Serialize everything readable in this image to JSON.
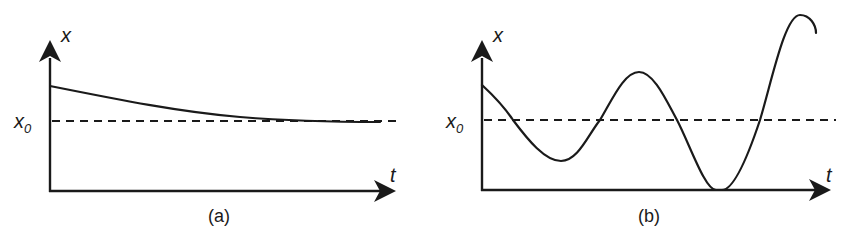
{
  "figure": {
    "panels": [
      {
        "id": "a",
        "caption": "(a)",
        "y_axis_label": "x",
        "x_axis_label": "t",
        "reference_label": "x",
        "reference_subscript": "0",
        "description": "Curve starts above x0 and decays monotonically toward x0"
      },
      {
        "id": "b",
        "caption": "(b)",
        "y_axis_label": "x",
        "x_axis_label": "t",
        "reference_label": "x",
        "reference_subscript": "0",
        "description": "Curve starts above x0 and oscillates with growing amplitude about x0"
      }
    ],
    "colors": {
      "ink": "#1a1a1a",
      "background": "#ffffff"
    }
  }
}
